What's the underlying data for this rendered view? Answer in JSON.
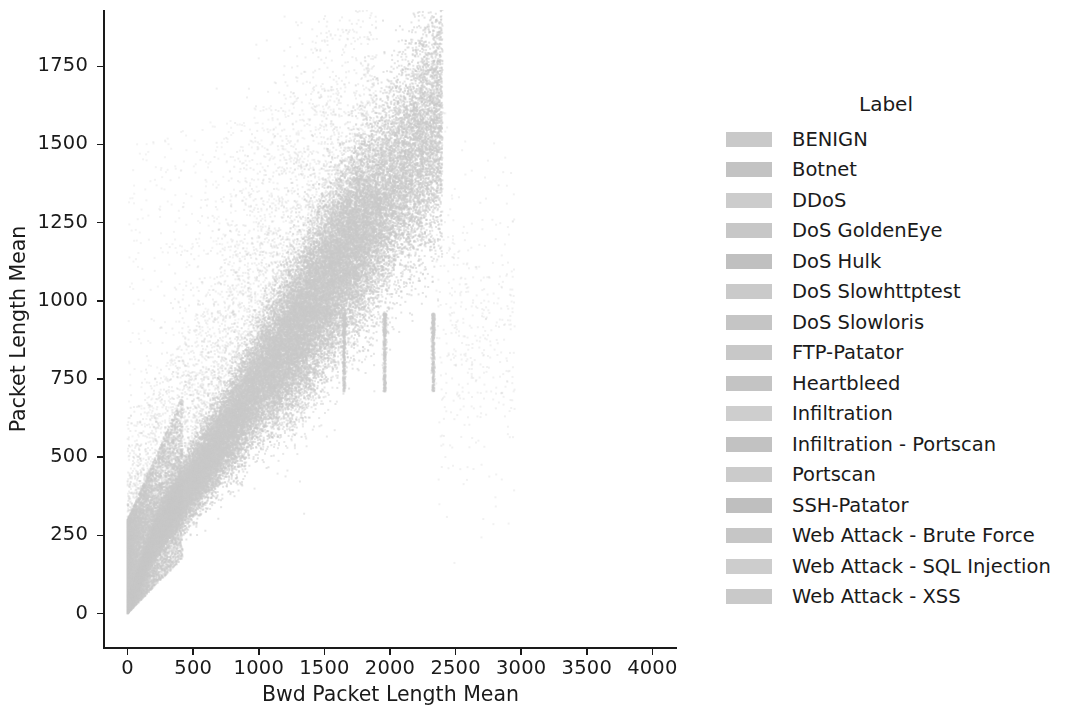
{
  "chart_data": {
    "type": "scatter",
    "title": "",
    "xlabel": "Bwd Packet Length Mean",
    "ylabel": "Packet Length Mean",
    "xlim": [
      -180,
      4180
    ],
    "ylim": [
      -110,
      1930
    ],
    "xticks": [
      0,
      500,
      1000,
      1500,
      2000,
      2500,
      3000,
      3500,
      4000
    ],
    "xtick_labels": [
      "0",
      "500",
      "1000",
      "1500",
      "2000",
      "2500",
      "3000",
      "3500",
      "4000"
    ],
    "yticks": [
      0,
      250,
      500,
      750,
      1000,
      1250,
      1500,
      1750
    ],
    "ytick_labels": [
      "0",
      "250",
      "500",
      "750",
      "1000",
      "1250",
      "1500",
      "1750"
    ],
    "grid": false,
    "legend_position": "right",
    "legend_title": "Label",
    "point_color": "#c9c9c9",
    "point_size": 1.6,
    "series": [
      {
        "name": "BENIGN",
        "color": "#c9c9c9"
      },
      {
        "name": "Botnet",
        "color": "#c3c3c3"
      },
      {
        "name": "DDoS",
        "color": "#cccccc"
      },
      {
        "name": "DoS GoldenEye",
        "color": "#c7c7c7"
      },
      {
        "name": "DoS Hulk",
        "color": "#c0c0c0"
      },
      {
        "name": "DoS Slowhttptest",
        "color": "#cacaca"
      },
      {
        "name": "DoS Slowloris",
        "color": "#c5c5c5"
      },
      {
        "name": "FTP-Patator",
        "color": "#c8c8c8"
      },
      {
        "name": "Heartbleed",
        "color": "#c4c4c4"
      },
      {
        "name": "Infiltration",
        "color": "#cecece"
      },
      {
        "name": "Infiltration - Portscan",
        "color": "#c2c2c2"
      },
      {
        "name": "Portscan",
        "color": "#cbcbcb"
      },
      {
        "name": "SSH-Patator",
        "color": "#bfbfbf"
      },
      {
        "name": "Web Attack - Brute Force",
        "color": "#c6c6c6"
      },
      {
        "name": "Web Attack - SQL Injection",
        "color": "#cdcdcd"
      },
      {
        "name": "Web Attack - XSS",
        "color": "#c9c9c9"
      }
    ],
    "cloud_description": {
      "main_band_x_range": [
        0,
        2400
      ],
      "main_band_y_range": [
        0,
        1500
      ],
      "relation": "y approximately 0.62*x + 120, widening fan from origin",
      "vertical_streaks_x": [
        1650,
        1960,
        2330
      ],
      "vertical_streak_y_range": [
        710,
        960
      ]
    }
  },
  "axes": {
    "xlabel": "Bwd Packet Length Mean",
    "ylabel": "Packet Length Mean"
  },
  "legend": {
    "title": "Label",
    "items": [
      {
        "label": "BENIGN"
      },
      {
        "label": "Botnet"
      },
      {
        "label": "DDoS"
      },
      {
        "label": "DoS GoldenEye"
      },
      {
        "label": "DoS Hulk"
      },
      {
        "label": "DoS Slowhttptest"
      },
      {
        "label": "DoS Slowloris"
      },
      {
        "label": "FTP-Patator"
      },
      {
        "label": "Heartbleed"
      },
      {
        "label": "Infiltration"
      },
      {
        "label": "Infiltration - Portscan"
      },
      {
        "label": "Portscan"
      },
      {
        "label": "SSH-Patator"
      },
      {
        "label": "Web Attack - Brute Force"
      },
      {
        "label": "Web Attack - SQL Injection"
      },
      {
        "label": "Web Attack - XSS"
      }
    ]
  }
}
